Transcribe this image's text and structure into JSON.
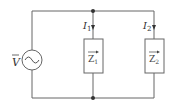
{
  "diagram": {
    "type": "circuit",
    "source": {
      "label": "V",
      "overline": true,
      "symbol": "ac-source"
    },
    "branches": [
      {
        "current": "I",
        "current_sub": "1",
        "impedance": "Z",
        "impedance_sub": "1"
      },
      {
        "current": "I",
        "current_sub": "2",
        "impedance": "Z",
        "impedance_sub": "2"
      }
    ],
    "colors": {
      "wire": "#666666",
      "text": "#333333"
    }
  }
}
